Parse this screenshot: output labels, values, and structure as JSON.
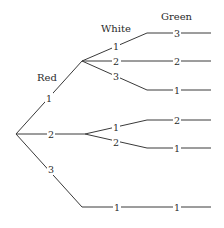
{
  "diagram": {
    "type": "tree",
    "headers": {
      "level1": "Red",
      "level2": "White",
      "level3": "Green"
    },
    "branches": [
      {
        "red": "1",
        "white": [
          {
            "label": "1",
            "green": "3"
          },
          {
            "label": "2",
            "green": "2"
          },
          {
            "label": "3",
            "green": "1"
          }
        ]
      },
      {
        "red": "2",
        "white": [
          {
            "label": "1",
            "green": "2"
          },
          {
            "label": "2",
            "green": "1"
          }
        ]
      },
      {
        "red": "3",
        "white": [
          {
            "label": "1",
            "green": "1"
          }
        ]
      }
    ],
    "colors": {
      "line": "#3a3a3a",
      "text": "#2a2a2a",
      "background": "#ffffff"
    }
  }
}
